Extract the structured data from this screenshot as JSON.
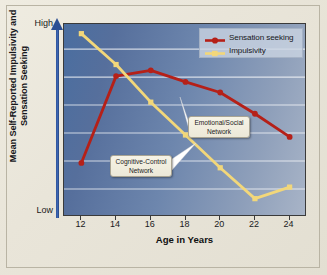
{
  "chart_data": {
    "type": "line",
    "title": "",
    "xlabel": "Age in Years",
    "ylabel": "Mean Self-Reported Impulsivity and Sensation Seeking",
    "x": [
      12,
      14,
      16,
      18,
      20,
      22,
      24
    ],
    "xlim": [
      11,
      25
    ],
    "ylim": [
      0,
      1
    ],
    "ytick_labels": [
      "Low",
      "High"
    ],
    "y_axis_low_label": "Low",
    "y_axis_high_label": "High",
    "grid": "horizontal",
    "legend_position": "top-right",
    "series": [
      {
        "name": "Sensation seeking",
        "color": "#b52018",
        "marker": "circle",
        "values": [
          0.28,
          0.73,
          0.76,
          0.7,
          0.645,
          0.535,
          0.415
        ]
      },
      {
        "name": "Impulsivity",
        "color": "#f2d77a",
        "marker": "square",
        "values": [
          0.95,
          0.79,
          0.595,
          0.425,
          0.255,
          0.095,
          0.155
        ]
      }
    ],
    "annotations": [
      {
        "id": "emotional-social",
        "line1": "Emotional/Social",
        "line2": "Network",
        "points_to_series": "Sensation seeking"
      },
      {
        "id": "cognitive-control",
        "line1": "Cognitive-Control",
        "line2": "Network",
        "points_to_series": "Impulsivity"
      }
    ]
  },
  "axes": {
    "y_title": "Mean Self-Reported Impulsivity and Sensation Seeking",
    "y_high": "High",
    "y_low": "Low",
    "x_title": "Age in Years",
    "x_ticks": [
      "12",
      "14",
      "16",
      "18",
      "20",
      "22",
      "24"
    ]
  },
  "legend": {
    "items": [
      {
        "label": "Sensation seeking",
        "color": "#b52018"
      },
      {
        "label": "Impulsivity",
        "color": "#f2d77a"
      }
    ]
  },
  "annotations": {
    "emotional": {
      "line1": "Emotional/Social",
      "line2": "Network"
    },
    "cognitive": {
      "line1": "Cognitive-Control",
      "line2": "Network"
    }
  },
  "colors": {
    "sensation_seeking": "#b52018",
    "impulsivity": "#f2d77a",
    "plot_background": "#6d86ad",
    "arrow": "#2c4f93",
    "page_background": "#e8e4d8"
  }
}
